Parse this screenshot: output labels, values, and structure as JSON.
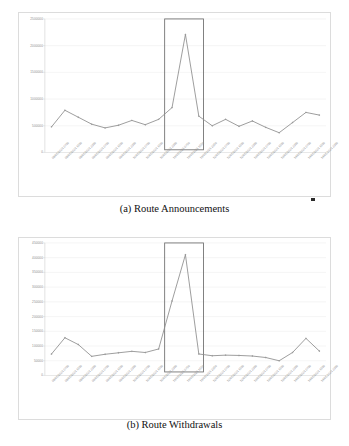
{
  "figure": {
    "panels": [
      {
        "id": "a",
        "caption": "(a) Route Announcements",
        "chart_ref": 0
      },
      {
        "id": "b",
        "caption": "(b) Route Withdrawals",
        "chart_ref": 1
      }
    ]
  },
  "chart_data": [
    {
      "type": "line",
      "title": "(a) Route Announcements",
      "xlabel": "",
      "ylabel": "",
      "ylim": [
        0,
        2500000
      ],
      "grid": true,
      "legend": "none",
      "yticks": [
        "0",
        "500000",
        "1000000",
        "1500000",
        "2000000",
        "2500000"
      ],
      "ytick_values": [
        0,
        500000,
        1000000,
        1500000,
        2000000,
        2500000
      ],
      "categories": [
        "08/05/2021 0750",
        "08/05/2021 1550",
        "08/05/2021 2350",
        "09/05/2021 0750",
        "09/05/2021 1550",
        "09/05/2021 2350",
        "10/05/2021 0750",
        "10/05/2021 1550",
        "10/05/2021 2350",
        "11/05/2021 0750",
        "11/05/2021 1550",
        "11/05/2021 2350",
        "12/05/2021 0750",
        "12/05/2021 1550",
        "12/05/2021 2350",
        "13/05/2021 0750",
        "13/05/2021 1550",
        "13/05/2021 2350",
        "14/05/2021 0750",
        "14/05/2021 1550",
        "14/05/2021 2350"
      ],
      "values": [
        480000,
        790000,
        660000,
        530000,
        460000,
        510000,
        600000,
        520000,
        620000,
        840000,
        2210000,
        680000,
        500000,
        620000,
        490000,
        590000,
        470000,
        370000,
        560000,
        750000,
        700000
      ],
      "annotations": [
        {
          "type": "highlight-rect",
          "x_start_index": 9,
          "x_end_index": 11,
          "y_bottom": 50000,
          "y_top": 2500000,
          "color": "#6b6b6b"
        }
      ]
    },
    {
      "type": "line",
      "title": "(b) Route Withdrawals",
      "xlabel": "",
      "ylabel": "",
      "ylim": [
        0,
        450000
      ],
      "grid": true,
      "legend": "none",
      "yticks": [
        "0",
        "50000",
        "100000",
        "150000",
        "200000",
        "250000",
        "300000",
        "350000",
        "400000",
        "450000"
      ],
      "ytick_values": [
        0,
        50000,
        100000,
        150000,
        200000,
        250000,
        300000,
        350000,
        400000,
        450000
      ],
      "categories": [
        "08/05/2021 0750",
        "08/05/2021 1550",
        "08/05/2021 2350",
        "09/05/2021 0750",
        "09/05/2021 1550",
        "09/05/2021 2350",
        "10/05/2021 0750",
        "10/05/2021 1550",
        "10/05/2021 2350",
        "11/05/2021 0750",
        "11/05/2021 1550",
        "11/05/2021 2350",
        "12/05/2021 0750",
        "12/05/2021 1550",
        "12/05/2021 2350",
        "13/05/2021 0750",
        "13/05/2021 1550",
        "13/05/2021 2350",
        "14/05/2021 0750",
        "14/05/2021 1550",
        "14/05/2021 2350"
      ],
      "values": [
        73000,
        128000,
        105000,
        65000,
        72000,
        77000,
        82000,
        78000,
        90000,
        253000,
        410000,
        73000,
        67000,
        69000,
        68000,
        66000,
        61000,
        50000,
        78000,
        126000,
        83000
      ],
      "annotations": [
        {
          "type": "highlight-rect",
          "x_start_index": 9,
          "x_end_index": 11,
          "y_bottom": 12000,
          "y_top": 450000,
          "color": "#6b6b6b"
        }
      ]
    }
  ],
  "style": {
    "line_color": "#8c8c8c",
    "marker_color": "#9a9a9a",
    "grid_color": "#e9e9e9",
    "axis_color": "#cfcfcf",
    "frame_color": "#dcdcdc",
    "tick_text_color": "#8a8a8a",
    "caption_color": "#111111"
  }
}
